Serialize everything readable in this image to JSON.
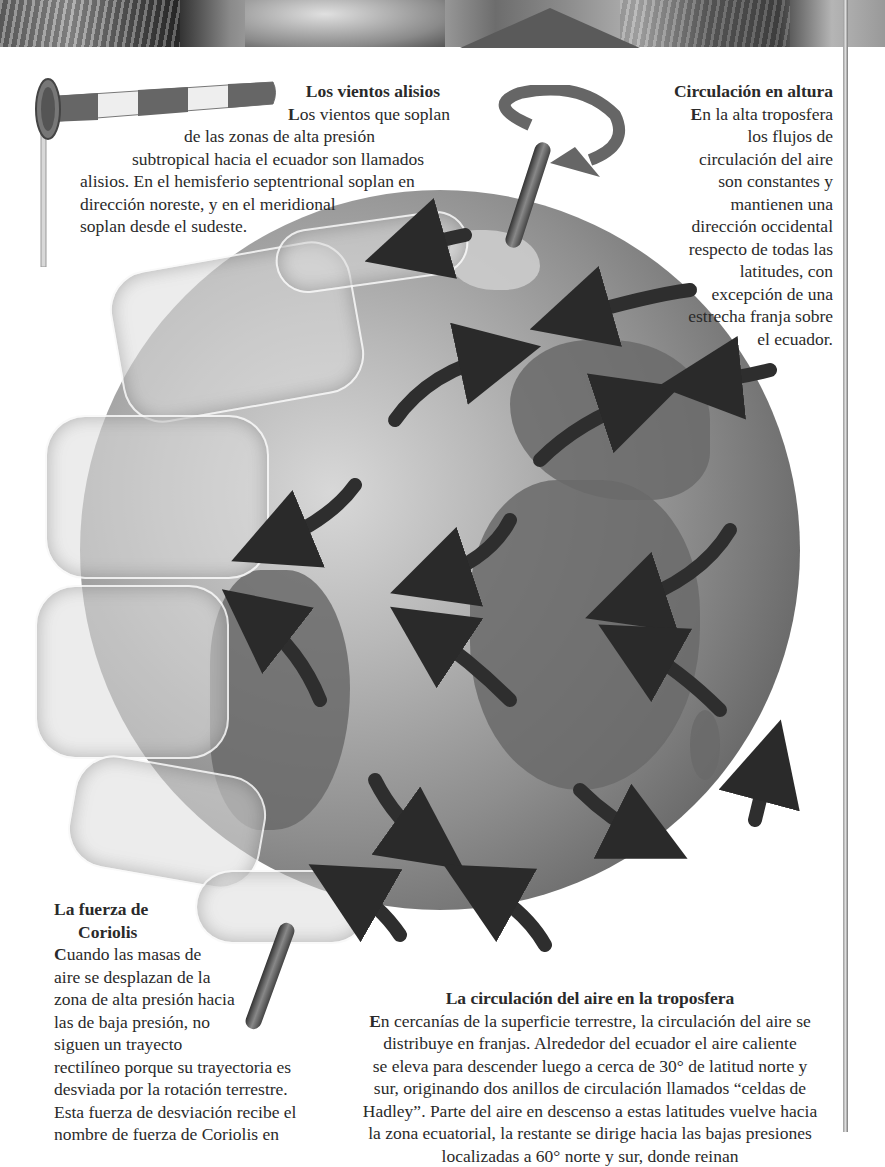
{
  "banner": {
    "description": "grayscale photo collage strip"
  },
  "sections": {
    "alisios": {
      "title": "Los vientos alisios",
      "initial": "L",
      "lines": [
        "os vientos que soplan",
        "de las zonas de alta presión",
        "subtropical hacia el ecuador son llamados",
        "alisios. En el hemisferio septentrional soplan en",
        "dirección noreste, y en el meridional",
        "soplan desde el sudeste."
      ]
    },
    "altura": {
      "title": "Circulación en altura",
      "initial": "E",
      "lines": [
        "n la alta troposfera",
        "los flujos de",
        "circulación del aire",
        "son constantes y",
        "mantienen una",
        "dirección occidental",
        "respecto de todas las",
        "latitudes, con",
        "excepción de una",
        "estrecha franja sobre",
        "el ecuador."
      ]
    },
    "coriolis": {
      "title_line1": "La fuerza de",
      "title_line2": "Coriolis",
      "initial": "C",
      "lines": [
        "uando las masas de",
        "aire se desplazan de la",
        "zona de alta presión hacia",
        "las de baja presión, no",
        "siguen un trayecto",
        "rectilíneo porque su trayectoria es",
        "desviada por la rotación terrestre.",
        "Esta fuerza de desviación recibe el",
        "nombre de fuerza de Coriolis en"
      ]
    },
    "troposfera": {
      "title": "La circulación del aire en la troposfera",
      "initial": "E",
      "lines": [
        "n cercanías de la superficie terrestre, la circulación del aire se",
        "distribuye en franjas. Alrededor del ecuador el aire caliente",
        "se eleva para descender luego a cerca de 30° de latitud norte y",
        "sur, originando dos anillos de circulación llamados “celdas de",
        "Hadley”. Parte del aire en descenso a estas latitudes vuelve hacia",
        "la zona ecuatorial, la restante se dirige hacia las bajas presiones",
        "localizadas a 60° norte y sur, donde reinan"
      ]
    }
  },
  "illustrations": {
    "windsock": "windsock-icon",
    "globe": "earth-globe with wind circulation arrows",
    "rotation_arrow": "rotation-arrow-icon"
  }
}
